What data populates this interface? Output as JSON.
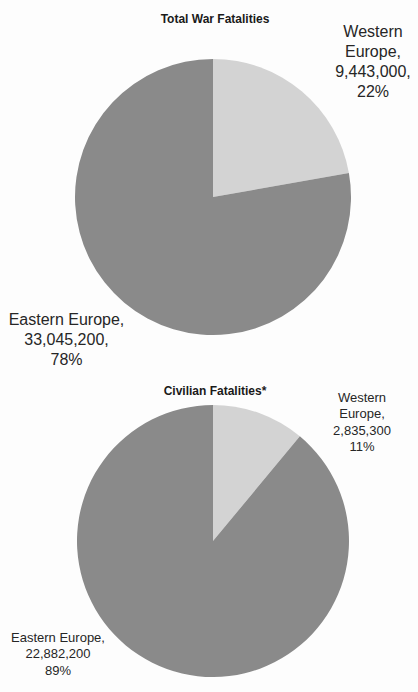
{
  "chart_data": [
    {
      "type": "pie",
      "title": "Total War Fatalities",
      "categories": [
        "Western Europe",
        "Eastern Europe"
      ],
      "values": [
        9443000,
        33045200
      ],
      "percentages": [
        22,
        78
      ],
      "data_labels": [
        [
          "Western",
          "Europe,",
          "9,443,000,",
          "22%"
        ],
        [
          "Eastern Europe,",
          "33,045,200,",
          "78%"
        ]
      ],
      "colors": [
        "#d3d3d3",
        "#8a8a8a"
      ],
      "start_angle_deg": 0,
      "direction": "clockwise"
    },
    {
      "type": "pie",
      "title": "Civilian Fatalities*",
      "categories": [
        "Western Europe",
        "Eastern Europe"
      ],
      "values": [
        2835300,
        22882200
      ],
      "percentages": [
        11,
        89
      ],
      "data_labels": [
        [
          "Western",
          "Europe,",
          "2,835,300",
          "11%"
        ],
        [
          "Eastern Europe,",
          "22,882,200",
          "89%"
        ]
      ],
      "colors": [
        "#d3d3d3",
        "#8a8a8a"
      ],
      "start_angle_deg": 0,
      "direction": "clockwise"
    }
  ]
}
